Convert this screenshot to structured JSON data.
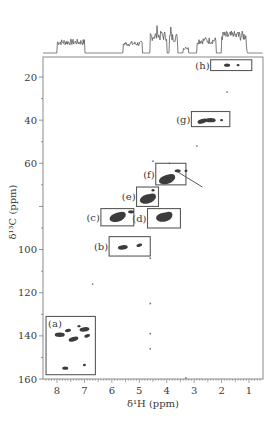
{
  "chart_data": {
    "type": "heatmap",
    "subtype": "2D NMR HSQC (1H-13C) contour spectrum with 1D 1H projection",
    "title": "",
    "xlabel": "δ¹H (ppm)",
    "ylabel": "δ¹³C (ppm)",
    "xlim": [
      8.5,
      0.5
    ],
    "ylim": [
      160,
      10.5
    ],
    "x_axis_reversed": true,
    "y_axis_reversed": true,
    "x_ticks": [
      8,
      7,
      6,
      5,
      4,
      3,
      2,
      1
    ],
    "y_ticks": [
      20,
      40,
      60,
      80,
      100,
      120,
      140,
      160
    ],
    "y_tick_labels_shown": [
      "20",
      "40",
      "60",
      "",
      "100",
      "120",
      "140",
      "160"
    ],
    "grid": false,
    "legend": null,
    "projection_1d": {
      "nucleus": "1H",
      "position": "top",
      "description": "1H spectrum with peak clusters around 7.0-8.0, 4.5-5.6, 3.3-4.3, 1.0-2.8 ppm"
    },
    "regions": [
      {
        "label": "(h)",
        "h_range": [
          0.9,
          2.4
        ],
        "c_range": [
          12,
          17
        ],
        "description": "methyl cross-peaks"
      },
      {
        "label": "(g)",
        "h_range": [
          1.7,
          3.1
        ],
        "c_range": [
          36,
          43
        ],
        "description": "methylene cross-peaks"
      },
      {
        "label": "(f)",
        "h_range": [
          3.3,
          4.4
        ],
        "c_range": [
          60,
          70
        ],
        "description": "cross-peaks with arrow annotation"
      },
      {
        "label": "(e)",
        "h_range": [
          4.3,
          5.1
        ],
        "c_range": [
          71,
          80
        ],
        "description": "cross-peaks"
      },
      {
        "label": "(d)",
        "h_range": [
          3.5,
          4.7
        ],
        "c_range": [
          81,
          90
        ],
        "description": "cross-peaks"
      },
      {
        "label": "(c)",
        "h_range": [
          5.2,
          6.4
        ],
        "c_range": [
          81,
          89
        ],
        "description": "cross-peaks"
      },
      {
        "label": "(b)",
        "h_range": [
          4.6,
          6.1
        ],
        "c_range": [
          94,
          103
        ],
        "description": "anomeric cross-peaks"
      },
      {
        "label": "(a)",
        "h_range": [
          6.6,
          8.4
        ],
        "c_range": [
          131,
          158
        ],
        "description": "aromatic cross-peaks"
      }
    ],
    "cross_peaks": [
      {
        "region": "(h)",
        "h": 1.8,
        "c": 14.5,
        "size": "small"
      },
      {
        "region": "(h)",
        "h": 1.4,
        "c": 14.5,
        "size": "tiny"
      },
      {
        "region": "(g)",
        "h": 2.7,
        "c": 40.5,
        "size": "medium"
      },
      {
        "region": "(g)",
        "h": 2.4,
        "c": 40.0,
        "size": "medium"
      },
      {
        "region": "(g)",
        "h": 2.0,
        "c": 40.0,
        "size": "tiny"
      },
      {
        "region": "(f)",
        "h": 4.0,
        "c": 67.5,
        "size": "large"
      },
      {
        "region": "(f)",
        "h": 3.6,
        "c": 63.5,
        "size": "small"
      },
      {
        "region": "(f)",
        "h": 3.3,
        "c": 63.5,
        "size": "tiny"
      },
      {
        "region": "(e)",
        "h": 4.7,
        "c": 76.5,
        "size": "large"
      },
      {
        "region": "(e)",
        "h": 4.5,
        "c": 72.5,
        "size": "tiny"
      },
      {
        "region": "(d)",
        "h": 4.1,
        "c": 85.0,
        "size": "large"
      },
      {
        "region": "(c)",
        "h": 5.8,
        "c": 85.0,
        "size": "large"
      },
      {
        "region": "(c)",
        "h": 5.3,
        "c": 82.5,
        "size": "small"
      },
      {
        "region": "(b)",
        "h": 5.6,
        "c": 99.0,
        "size": "medium"
      },
      {
        "region": "(b)",
        "h": 5.0,
        "c": 98.0,
        "size": "small"
      },
      {
        "region": "(a)",
        "h": 7.9,
        "c": 139.5,
        "size": "medium"
      },
      {
        "region": "(a)",
        "h": 7.6,
        "c": 137.5,
        "size": "small"
      },
      {
        "region": "(a)",
        "h": 7.4,
        "c": 141.5,
        "size": "medium"
      },
      {
        "region": "(a)",
        "h": 7.2,
        "c": 135.5,
        "size": "tiny"
      },
      {
        "region": "(a)",
        "h": 7.0,
        "c": 137.0,
        "size": "medium"
      },
      {
        "region": "(a)",
        "h": 6.9,
        "c": 140.0,
        "size": "small"
      },
      {
        "region": "(a)",
        "h": 7.7,
        "c": 155.0,
        "size": "small"
      },
      {
        "region": "(a)",
        "h": 7.0,
        "c": 153.5,
        "size": "tiny"
      }
    ],
    "stray_peaks": [
      {
        "h": 6.7,
        "c": 116
      },
      {
        "h": 4.6,
        "c": 104
      },
      {
        "h": 4.6,
        "c": 125
      },
      {
        "h": 4.6,
        "c": 139
      },
      {
        "h": 4.6,
        "c": 146
      },
      {
        "h": 3.3,
        "c": 159.5
      },
      {
        "h": 1.8,
        "c": 27
      },
      {
        "h": 2.9,
        "c": 52
      },
      {
        "h": 4.5,
        "c": 59
      },
      {
        "h": 3.9,
        "c": 60
      }
    ]
  },
  "labels": {
    "x_axis_title": "δ¹H (ppm)",
    "y_axis_title": "δ¹³C (ppm)",
    "x_tick_labels": [
      "8",
      "7",
      "6",
      "5",
      "4",
      "3",
      "2",
      "1"
    ],
    "y_tick_labels": [
      "20",
      "40",
      "60",
      "100",
      "120",
      "140",
      "160"
    ],
    "box_labels": [
      "(a)",
      "(b)",
      "(c)",
      "(d)",
      "(e)",
      "(f)",
      "(g)",
      "(h)"
    ]
  },
  "colors": {
    "frame": "#7a7a7a",
    "box": "#5a5a5a",
    "peak": "#3c3c3c",
    "trace": "#5a5a5a",
    "text": "#3a3a3a"
  }
}
